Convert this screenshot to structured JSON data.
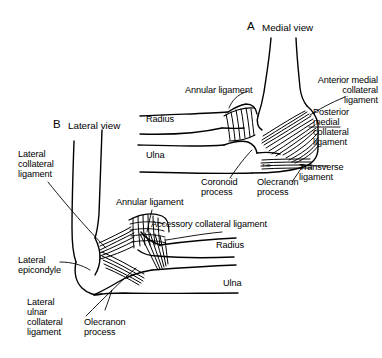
{
  "figure": {
    "background_color": "#ffffff",
    "ink_color": "#000000"
  },
  "panels": [
    {
      "letter": "A",
      "title": "Medial view",
      "labels": [
        {
          "name": "annular-ligament",
          "text": "Annular ligament"
        },
        {
          "name": "radius",
          "text": "Radius"
        },
        {
          "name": "ulna",
          "text": "Ulna"
        },
        {
          "name": "anterior-medial-collateral-ligament",
          "text": "Anterior medial\ncollateral\nligament"
        },
        {
          "name": "posterior-medial-collateral-ligament",
          "text": "Posterior\nmedial\ncollateral\nligament"
        },
        {
          "name": "transverse-ligament",
          "text": "Transverse\nligament"
        },
        {
          "name": "coronoid-process",
          "text": "Coronoid\nprocess"
        },
        {
          "name": "olecranon-process",
          "text": "Olecranon\nprocess"
        }
      ]
    },
    {
      "letter": "B",
      "title": "Lateral view",
      "labels": [
        {
          "name": "lateral-collateral-ligament",
          "text": "Lateral\ncollateral\nligament"
        },
        {
          "name": "annular-ligament",
          "text": "Annular ligament"
        },
        {
          "name": "accessory-collateral-ligament",
          "text": "Accessory collateral ligament"
        },
        {
          "name": "radius",
          "text": "Radius"
        },
        {
          "name": "ulna",
          "text": "Ulna"
        },
        {
          "name": "lateral-epicondyle",
          "text": "Lateral\nepicondyle"
        },
        {
          "name": "lateral-ulnar-collateral-ligament",
          "text": "Lateral\nulnar\ncollateral\nligament"
        },
        {
          "name": "olecranon-process",
          "text": "Olecranon\nprocess"
        }
      ]
    }
  ],
  "panel_a": {
    "letter": "A",
    "title": "Medial view",
    "annular_ligament": "Annular ligament",
    "radius": "Radius",
    "ulna": "Ulna",
    "anterior_medial_collateral_ligament_l1": "Anterior medial",
    "anterior_medial_collateral_ligament_l2": "collateral",
    "anterior_medial_collateral_ligament_l3": "ligament",
    "posterior_medial_collateral_ligament_l1": "Posterior",
    "posterior_medial_collateral_ligament_l2": "medial",
    "posterior_medial_collateral_ligament_l3": "collateral",
    "posterior_medial_collateral_ligament_l4": "ligament",
    "transverse_ligament_l1": "Transverse",
    "transverse_ligament_l2": "ligament",
    "coronoid_process_l1": "Coronoid",
    "coronoid_process_l2": "process",
    "olecranon_process_l1": "Olecranon",
    "olecranon_process_l2": "process",
    "signature": "T.Ж"
  },
  "panel_b": {
    "letter": "B",
    "title": "Lateral view",
    "lateral_collateral_ligament_l1": "Lateral",
    "lateral_collateral_ligament_l2": "collateral",
    "lateral_collateral_ligament_l3": "ligament",
    "annular_ligament": "Annular ligament",
    "accessory_collateral_ligament": "Accessory collateral ligament",
    "radius": "Radius",
    "ulna": "Ulna",
    "lateral_epicondyle_l1": "Lateral",
    "lateral_epicondyle_l2": "epicondyle",
    "lateral_ulnar_collateral_ligament_l1": "Lateral",
    "lateral_ulnar_collateral_ligament_l2": "ulnar",
    "lateral_ulnar_collateral_ligament_l3": "collateral",
    "lateral_ulnar_collateral_ligament_l4": "ligament",
    "olecranon_process_l1": "Olecranon",
    "olecranon_process_l2": "process"
  }
}
